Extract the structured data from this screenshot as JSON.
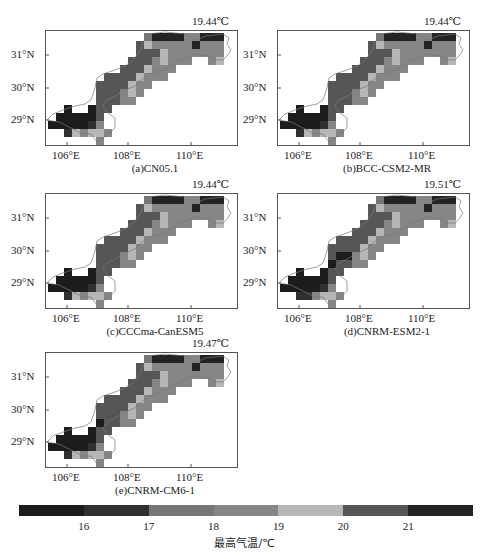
{
  "chart_data": {
    "type": "heatmap",
    "title": "",
    "colorbar": {
      "label": "最高气温/℃",
      "ticks": [
        "16",
        "17",
        "18",
        "19",
        "20",
        "21"
      ],
      "colors": [
        "#1c1c1c",
        "#303030",
        "#767676",
        "#868686",
        "#b6b6b6",
        "#565656",
        "#232323"
      ],
      "bins": [
        "<16",
        "16-17",
        "17-18",
        "18-19",
        "19-20",
        "20-21",
        ">21"
      ]
    },
    "x_axis": {
      "ticks": [
        "106°E",
        "108°E",
        "110°E"
      ],
      "range": [
        105.5,
        111.7
      ]
    },
    "y_axis": {
      "ticks": [
        "29°N",
        "30°N",
        "31°N"
      ],
      "range": [
        28.2,
        31.7
      ]
    },
    "panels": [
      {
        "id": "a",
        "label": "(a)CN05.1",
        "mean": "19.44℃"
      },
      {
        "id": "b",
        "label": "(b)BCC-CSM2-MR",
        "mean": "19.44℃"
      },
      {
        "id": "c",
        "label": "(c)CCCma-CanESM5",
        "mean": "19.44℃"
      },
      {
        "id": "d",
        "label": "(d)CNRM-ESM2-1",
        "mean": "19.51℃"
      },
      {
        "id": "e",
        "label": "(e)CNRM-CM6-1",
        "mean": "19.47℃"
      }
    ],
    "grid_cells_note": "approximate cell color bin index per [col,row]; cell size ~0.26°",
    "cells_base": [
      [
        12,
        0,
        2
      ],
      [
        13,
        0,
        6
      ],
      [
        14,
        0,
        6
      ],
      [
        15,
        0,
        6
      ],
      [
        16,
        0,
        6
      ],
      [
        17,
        0,
        3
      ],
      [
        18,
        0,
        3
      ],
      [
        19,
        0,
        6
      ],
      [
        20,
        0,
        6
      ],
      [
        21,
        0,
        6
      ],
      [
        11,
        1,
        5
      ],
      [
        12,
        1,
        4
      ],
      [
        13,
        1,
        3
      ],
      [
        14,
        1,
        3
      ],
      [
        15,
        1,
        3
      ],
      [
        16,
        1,
        3
      ],
      [
        17,
        1,
        3
      ],
      [
        18,
        1,
        6
      ],
      [
        19,
        1,
        3
      ],
      [
        20,
        1,
        3
      ],
      [
        21,
        1,
        3
      ],
      [
        11,
        2,
        5
      ],
      [
        12,
        2,
        5
      ],
      [
        13,
        2,
        5
      ],
      [
        14,
        2,
        4
      ],
      [
        15,
        2,
        3
      ],
      [
        16,
        2,
        3
      ],
      [
        17,
        2,
        3
      ],
      [
        18,
        2,
        3
      ],
      [
        19,
        2,
        3
      ],
      [
        20,
        2,
        3
      ],
      [
        21,
        2,
        3
      ],
      [
        10,
        3,
        5
      ],
      [
        11,
        3,
        5
      ],
      [
        12,
        3,
        5
      ],
      [
        13,
        3,
        3
      ],
      [
        14,
        3,
        4
      ],
      [
        15,
        3,
        3
      ],
      [
        16,
        3,
        3
      ],
      [
        17,
        3,
        3
      ],
      [
        20,
        3,
        3
      ],
      [
        21,
        3,
        4
      ],
      [
        9,
        4,
        5
      ],
      [
        10,
        4,
        5
      ],
      [
        11,
        4,
        5
      ],
      [
        12,
        4,
        4
      ],
      [
        13,
        4,
        3
      ],
      [
        14,
        4,
        3
      ],
      [
        15,
        4,
        3
      ],
      [
        7,
        5,
        5
      ],
      [
        8,
        5,
        5
      ],
      [
        9,
        5,
        5
      ],
      [
        10,
        5,
        5
      ],
      [
        11,
        5,
        4
      ],
      [
        12,
        5,
        3
      ],
      [
        13,
        5,
        3
      ],
      [
        14,
        5,
        3
      ],
      [
        6,
        6,
        5
      ],
      [
        7,
        6,
        5
      ],
      [
        8,
        6,
        5
      ],
      [
        9,
        6,
        5
      ],
      [
        10,
        6,
        4
      ],
      [
        11,
        6,
        3
      ],
      [
        12,
        6,
        3
      ],
      [
        6,
        7,
        5
      ],
      [
        7,
        6,
        5
      ],
      [
        7,
        7,
        5
      ],
      [
        8,
        7,
        5
      ],
      [
        9,
        7,
        3
      ],
      [
        10,
        7,
        4
      ],
      [
        11,
        7,
        3
      ],
      [
        6,
        8,
        5
      ],
      [
        7,
        8,
        5
      ],
      [
        8,
        8,
        5
      ],
      [
        9,
        8,
        3
      ],
      [
        10,
        8,
        3
      ],
      [
        2,
        9,
        0
      ],
      [
        5,
        9,
        0
      ],
      [
        6,
        9,
        5
      ],
      [
        7,
        9,
        5
      ],
      [
        1,
        10,
        0
      ],
      [
        2,
        10,
        0
      ],
      [
        3,
        10,
        0
      ],
      [
        4,
        10,
        0
      ],
      [
        5,
        10,
        0
      ],
      [
        6,
        10,
        5
      ],
      [
        0,
        11,
        0
      ],
      [
        1,
        11,
        0
      ],
      [
        2,
        11,
        0
      ],
      [
        3,
        11,
        0
      ],
      [
        4,
        11,
        0
      ],
      [
        5,
        11,
        1
      ],
      [
        6,
        11,
        3
      ],
      [
        2,
        12,
        1
      ],
      [
        3,
        12,
        4
      ],
      [
        4,
        12,
        3
      ],
      [
        5,
        12,
        4
      ],
      [
        6,
        12,
        4
      ],
      [
        7,
        12,
        3
      ],
      [
        6,
        13,
        3
      ]
    ],
    "panel_overrides": {
      "d": [
        [
          7,
          7,
          0
        ],
        [
          8,
          7,
          0
        ],
        [
          6,
          8,
          0
        ],
        [
          2,
          12,
          1
        ],
        [
          3,
          12,
          1
        ]
      ],
      "e": [
        [
          6,
          8,
          0
        ]
      ]
    }
  },
  "footer_partial_text": ""
}
